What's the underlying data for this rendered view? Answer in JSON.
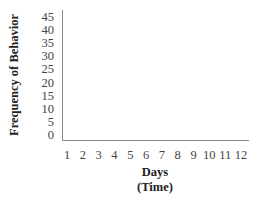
{
  "chart_data": {
    "type": "line",
    "title": "",
    "xlabel": "Days (Time)",
    "xlabel_lines": [
      "Days",
      "(Time)"
    ],
    "ylabel": "Frequency of Behavior",
    "categories": [
      "1",
      "2",
      "3",
      "4",
      "5",
      "6",
      "7",
      "8",
      "9",
      "10",
      "11",
      "12"
    ],
    "x": [
      1,
      2,
      3,
      4,
      5,
      6,
      7,
      8,
      9,
      10,
      11,
      12
    ],
    "series": [],
    "yticks": [
      "45",
      "40",
      "35",
      "30",
      "25",
      "20",
      "15",
      "10",
      "5",
      "0"
    ],
    "ylim": [
      0,
      45
    ],
    "grid": false,
    "legend": null
  }
}
